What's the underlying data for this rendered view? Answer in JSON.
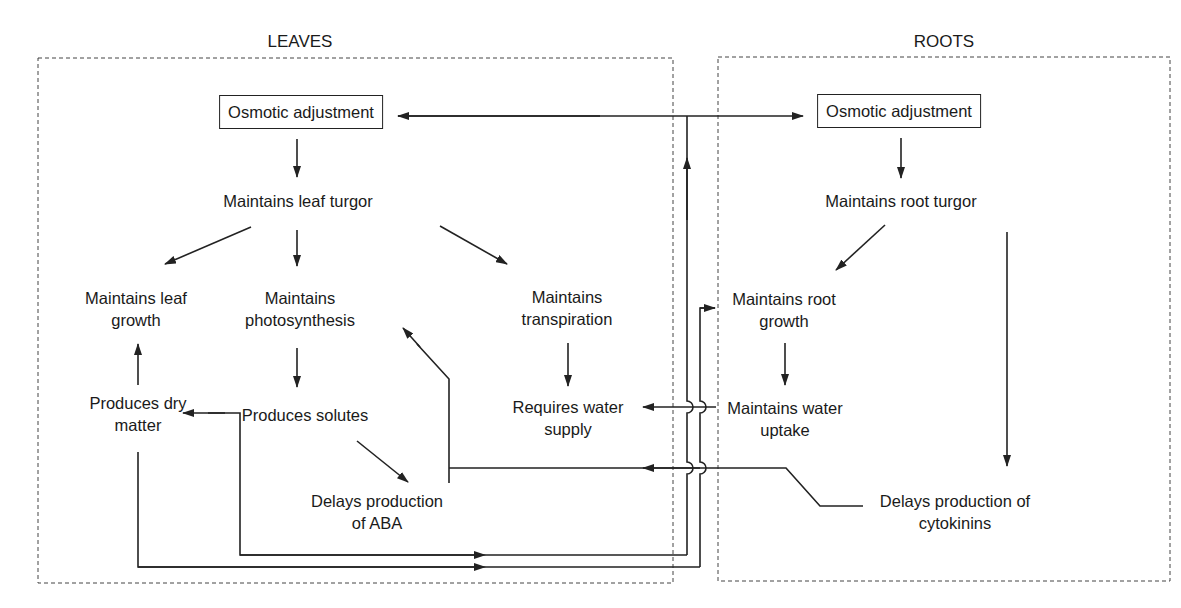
{
  "regions": {
    "leaves": {
      "title": "LEAVES"
    },
    "roots": {
      "title": "ROOTS"
    }
  },
  "nodes": {
    "leaf_osmotic": "Osmotic adjustment",
    "leaf_turgor": "Maintains leaf turgor",
    "leaf_growth_1": "Maintains leaf",
    "leaf_growth_2": "growth",
    "photosynth_1": "Maintains",
    "photosynth_2": "photosynthesis",
    "transpiration_1": "Maintains",
    "transpiration_2": "transpiration",
    "dry_matter_1": "Produces dry",
    "dry_matter_2": "matter",
    "solutes": "Produces solutes",
    "water_supply_1": "Requires water",
    "water_supply_2": "supply",
    "aba_1": "Delays production",
    "aba_2": "of ABA",
    "root_osmotic": "Osmotic adjustment",
    "root_turgor": "Maintains root turgor",
    "root_growth_1": "Maintains root",
    "root_growth_2": "growth",
    "water_uptake_1": "Maintains water",
    "water_uptake_2": "uptake",
    "cytokinins_1": "Delays production of",
    "cytokinins_2": "cytokinins"
  },
  "colors": {
    "line": "#222222",
    "dashed_border": "#444444",
    "background": "#ffffff"
  }
}
